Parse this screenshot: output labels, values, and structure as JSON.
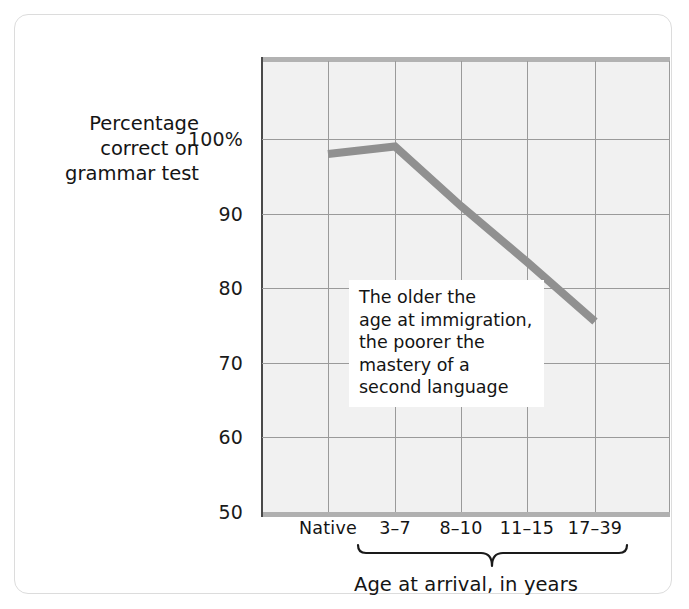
{
  "chart_data": {
    "type": "line",
    "title": "",
    "subtitle": "",
    "xlabel": "Age at arrival, in years",
    "ylabel": "Percentage correct on grammar test",
    "categories": [
      "Native",
      "3–7",
      "8–10",
      "11–15",
      "17–39"
    ],
    "values": [
      98,
      99,
      91,
      83.5,
      75.5
    ],
    "series": [
      {
        "name": "Percentage correct on grammar test",
        "values": [
          98,
          99,
          91,
          83.5,
          75.5
        ]
      }
    ],
    "ylim": [
      50,
      107
    ],
    "y_ticks": [
      100,
      90,
      80,
      70,
      60,
      50
    ],
    "y_tick_labels": [
      "100%",
      "90",
      "80",
      "70",
      "60",
      "50"
    ],
    "x_tick_labels": [
      "Native",
      "3–7",
      "8–10",
      "11–15",
      "17–39"
    ],
    "grid": true,
    "legend": false,
    "annotations": [
      {
        "text": "The older the\nage at immigration,\nthe poorer the\nmastery of a\nsecond language",
        "x_category": "8–10",
        "y_value": 79
      }
    ],
    "brace": {
      "label": "Age at arrival, in years",
      "covers": [
        "3–7",
        "8–10",
        "11–15",
        "17–39"
      ]
    },
    "colors": {
      "line": "#909090",
      "plot_background": "#f1f1f1",
      "gridline": "#9a9a9a",
      "axis": "#4a4a4a",
      "axis_band": "#b0b0b0",
      "text": "#141414",
      "card_border": "#dcdcdc"
    }
  },
  "y_axis": {
    "title_lines": [
      "Percentage",
      "correct on",
      "grammar test"
    ],
    "ticks": [
      {
        "label": "100%",
        "value": 100
      },
      {
        "label": "90",
        "value": 90
      },
      {
        "label": "80",
        "value": 80
      },
      {
        "label": "70",
        "value": 70
      },
      {
        "label": "60",
        "value": 60
      },
      {
        "label": "50",
        "value": 50
      }
    ]
  },
  "x_axis": {
    "title": "Age at arrival, in years",
    "ticks": [
      {
        "label": "Native"
      },
      {
        "label": "3–7"
      },
      {
        "label": "8–10"
      },
      {
        "label": "11–15"
      },
      {
        "label": "17–39"
      }
    ]
  },
  "annotation": {
    "text": "The older the\nage at immigration,\nthe poorer the\nmastery of a\nsecond language"
  }
}
